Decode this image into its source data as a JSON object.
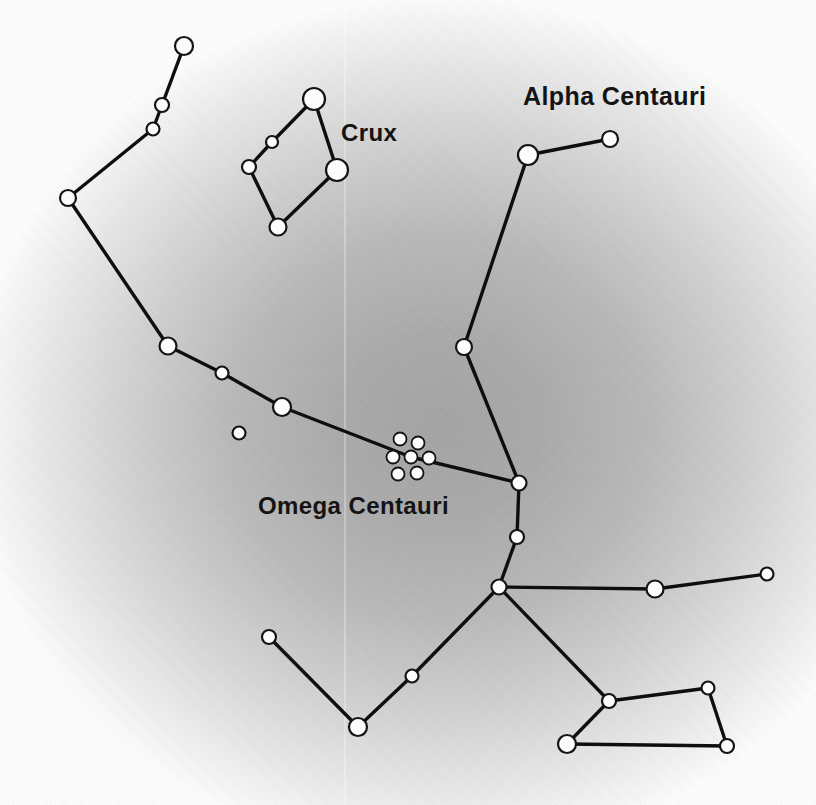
{
  "figure_title": "Southern sky star chart around Centaurus",
  "labels": {
    "crux": {
      "text": "Crux"
    },
    "alpha_centauri": {
      "text": "Alpha Centauri"
    },
    "omega_centauri": {
      "text": "Omega Centauri"
    }
  },
  "palette": {
    "background_core": "#a3a3a3",
    "background_edge": "#fcfcfc",
    "line_color": "#0e0e0e",
    "star_fill": "#fcfcfc",
    "star_stroke": "#141414",
    "label_color": "#141414"
  },
  "constellation_map": {
    "style": {
      "line_width": 3.4,
      "star_stroke_width": 2.2,
      "cluster_stroke_width": 1.8
    },
    "stars": [
      {
        "id": "tail-1",
        "x": 184,
        "y": 46,
        "r": 9
      },
      {
        "id": "tail-2",
        "x": 162,
        "y": 105,
        "r": 7
      },
      {
        "id": "tail-3",
        "x": 153,
        "y": 129,
        "r": 6.5
      },
      {
        "id": "tail-4",
        "x": 68,
        "y": 198,
        "r": 8
      },
      {
        "id": "tail-5",
        "x": 168,
        "y": 346,
        "r": 8.5
      },
      {
        "id": "tail-6",
        "x": 222,
        "y": 373,
        "r": 6.5
      },
      {
        "id": "tail-7",
        "x": 282,
        "y": 407,
        "r": 9
      },
      {
        "id": "lone-star",
        "x": 239,
        "y": 433,
        "r": 6.5
      },
      {
        "id": "alpha-cen-a",
        "x": 528,
        "y": 155,
        "r": 10
      },
      {
        "id": "alpha-cen-b",
        "x": 610,
        "y": 139,
        "r": 8
      },
      {
        "id": "beta-cen",
        "x": 464,
        "y": 347,
        "r": 8
      },
      {
        "id": "mid-1",
        "x": 519,
        "y": 483,
        "r": 7.5
      },
      {
        "id": "mid-2",
        "x": 517,
        "y": 537,
        "r": 7
      },
      {
        "id": "hub",
        "x": 499,
        "y": 587,
        "r": 7.5
      },
      {
        "id": "east-1",
        "x": 655,
        "y": 589,
        "r": 8.5
      },
      {
        "id": "east-2",
        "x": 767,
        "y": 574,
        "r": 6.5
      },
      {
        "id": "south-1",
        "x": 412,
        "y": 676,
        "r": 6.5
      },
      {
        "id": "south-2",
        "x": 358,
        "y": 727,
        "r": 9
      },
      {
        "id": "south-3",
        "x": 269,
        "y": 637,
        "r": 7
      },
      {
        "id": "quad-1",
        "x": 609,
        "y": 701,
        "r": 7
      },
      {
        "id": "quad-2",
        "x": 708,
        "y": 688,
        "r": 6.5
      },
      {
        "id": "quad-3",
        "x": 727,
        "y": 746,
        "r": 7
      },
      {
        "id": "quad-4",
        "x": 567,
        "y": 744,
        "r": 9
      },
      {
        "id": "crux-top",
        "x": 314,
        "y": 99,
        "r": 11
      },
      {
        "id": "crux-west-1",
        "x": 272,
        "y": 142,
        "r": 6
      },
      {
        "id": "crux-west-2",
        "x": 249,
        "y": 167,
        "r": 7
      },
      {
        "id": "crux-bottom",
        "x": 278,
        "y": 227,
        "r": 8.5
      },
      {
        "id": "crux-east",
        "x": 337,
        "y": 170,
        "r": 11
      },
      {
        "id": "cluster-dot-1",
        "x": 400,
        "y": 439,
        "r": 6.5,
        "cluster": true
      },
      {
        "id": "cluster-dot-2",
        "x": 418,
        "y": 443,
        "r": 6.5,
        "cluster": true
      },
      {
        "id": "cluster-dot-3",
        "x": 393,
        "y": 457,
        "r": 6.5,
        "cluster": true
      },
      {
        "id": "cluster-dot-4",
        "x": 411,
        "y": 457,
        "r": 6.5,
        "cluster": true
      },
      {
        "id": "cluster-dot-5",
        "x": 429,
        "y": 458,
        "r": 6.5,
        "cluster": true
      },
      {
        "id": "cluster-dot-6",
        "x": 398,
        "y": 474,
        "r": 6.5,
        "cluster": true
      },
      {
        "id": "cluster-dot-7",
        "x": 417,
        "y": 473,
        "r": 6.5,
        "cluster": true
      }
    ],
    "edges": [
      [
        "tail-1",
        "tail-2"
      ],
      [
        "tail-2",
        "tail-3"
      ],
      [
        "tail-3",
        "tail-4"
      ],
      [
        "tail-4",
        "tail-5"
      ],
      [
        "tail-5",
        "tail-6"
      ],
      [
        "tail-6",
        "tail-7"
      ],
      [
        "tail-7",
        "cluster-dot-4"
      ],
      [
        "cluster-dot-4",
        "mid-1"
      ],
      [
        "alpha-cen-b",
        "alpha-cen-a"
      ],
      [
        "alpha-cen-a",
        "beta-cen"
      ],
      [
        "beta-cen",
        "mid-1"
      ],
      [
        "mid-1",
        "mid-2"
      ],
      [
        "mid-2",
        "hub"
      ],
      [
        "hub",
        "east-1"
      ],
      [
        "east-1",
        "east-2"
      ],
      [
        "hub",
        "south-1"
      ],
      [
        "south-1",
        "south-2"
      ],
      [
        "south-2",
        "south-3"
      ],
      [
        "hub",
        "quad-1"
      ],
      [
        "quad-1",
        "quad-2"
      ],
      [
        "quad-2",
        "quad-3"
      ],
      [
        "quad-3",
        "quad-4"
      ],
      [
        "quad-4",
        "quad-1"
      ],
      [
        "crux-top",
        "crux-west-1"
      ],
      [
        "crux-west-1",
        "crux-west-2"
      ],
      [
        "crux-west-2",
        "crux-bottom"
      ],
      [
        "crux-bottom",
        "crux-east"
      ],
      [
        "crux-east",
        "crux-top"
      ]
    ]
  }
}
